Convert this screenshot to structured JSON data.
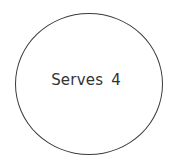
{
  "shape": {
    "type": "circle",
    "stroke_color": "#3a3a3a",
    "fill_color": "#ffffff"
  },
  "label": {
    "text": "Serves 4",
    "color": "#333333"
  }
}
